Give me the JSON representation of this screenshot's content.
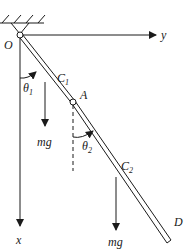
{
  "diagram": {
    "labels": {
      "origin": "O",
      "y_axis": "y",
      "x_axis": "x",
      "center1": "C",
      "center1_sub": "1",
      "center2": "C",
      "center2_sub": "2",
      "joint": "A",
      "end": "D",
      "theta1": "θ",
      "theta1_sub": "1",
      "theta2": "θ",
      "theta2_sub": "2",
      "weight1": "mg",
      "weight2": "mg"
    },
    "colors": {
      "line": "#1a1a1a",
      "background": "#ffffff"
    }
  }
}
